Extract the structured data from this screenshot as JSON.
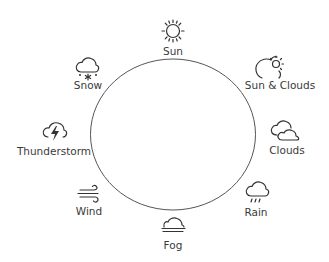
{
  "diagram": {
    "ring": {
      "cx": 173,
      "cy": 134.5,
      "rx": 82.5,
      "ry": 75.5,
      "stroke": "#555555"
    },
    "items": [
      {
        "key": "sun",
        "label": "Sun",
        "icon": "sun-icon"
      },
      {
        "key": "sun_clouds",
        "label": "Sun & Clouds",
        "icon": "sun-clouds-icon"
      },
      {
        "key": "clouds",
        "label": "Clouds",
        "icon": "clouds-icon"
      },
      {
        "key": "rain",
        "label": "Rain",
        "icon": "rain-icon"
      },
      {
        "key": "fog",
        "label": "Fog",
        "icon": "fog-icon"
      },
      {
        "key": "wind",
        "label": "Wind",
        "icon": "wind-icon"
      },
      {
        "key": "thunderstorm",
        "label": "Thunderstorm",
        "icon": "thunderstorm-icon"
      },
      {
        "key": "snow",
        "label": "Snow",
        "icon": "snow-icon"
      }
    ]
  }
}
